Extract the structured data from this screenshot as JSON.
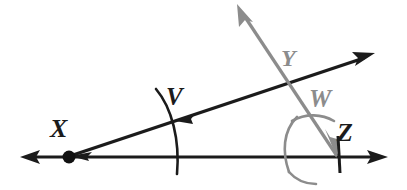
{
  "figure": {
    "type": "geometry-diagram",
    "background_color": "#ffffff"
  },
  "labels": {
    "x": "X",
    "v": "V",
    "y": "Y",
    "w": "W",
    "z": "Z"
  },
  "colors": {
    "ink_black": "#1b1b1b",
    "ink_gray": "#8c8c8c",
    "vertex_dot": "#111111"
  },
  "geometry": {
    "vertex_x": {
      "cx": 69,
      "cy": 157,
      "r": 6
    },
    "horizontal_line": {
      "x1": 22,
      "y1": 157,
      "x2": 385,
      "y2": 157,
      "left_arrow": true,
      "right_arrow": true,
      "color": "#1b1b1b"
    },
    "black_ray": {
      "x1": 69,
      "y1": 157,
      "x2": 371,
      "y2": 56,
      "arrow_end": true,
      "arrow_back_tick": true,
      "color": "#1b1b1b"
    },
    "gray_ray": {
      "x1": 338,
      "y1": 157,
      "x2": 239,
      "y2": 7,
      "arrow_end": true,
      "color": "#8c8c8c"
    },
    "arc_v": {
      "from": [
        156,
        89
      ],
      "to": [
        178,
        174
      ],
      "note": "compass arc centered at X crossing both black rays",
      "color": "#1b1b1b"
    },
    "arc_z_large": {
      "note": "large gray compass arc centered at Z from gray ray to horizontal",
      "color": "#8c8c8c"
    },
    "arc_w_small": {
      "note": "short gray arc crossing the gray ray at W",
      "color": "#8c8c8c"
    },
    "tick_z": {
      "x1": 338,
      "y1": 137,
      "x2": 339,
      "y2": 172,
      "color": "#1b1b1b"
    }
  }
}
